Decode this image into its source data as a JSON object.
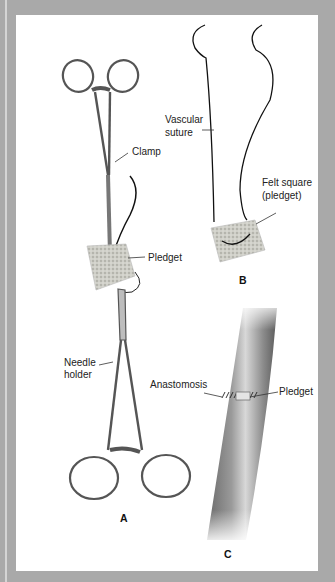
{
  "figure": {
    "panels": [
      {
        "id": "A",
        "label": "A",
        "callouts": [
          "Clamp",
          "Pledget",
          "Needle holder"
        ]
      },
      {
        "id": "B",
        "label": "B",
        "callouts": [
          "Vascular suture",
          "Felt square (pledget)"
        ]
      },
      {
        "id": "C",
        "label": "C",
        "callouts": [
          "Anastomosis",
          "Pledget"
        ]
      }
    ],
    "labels": {
      "clamp": "Clamp",
      "pledget_a": "Pledget",
      "needle_line1": "Needle",
      "needle_line2": "holder",
      "vascular_line1": "Vascular",
      "vascular_line2": "suture",
      "felt_line1": "Felt square",
      "felt_line2": "(pledget)",
      "anastomosis": "Anastomosis",
      "pledget_c": "Pledget",
      "panel_a": "A",
      "panel_b": "B",
      "panel_c": "C"
    },
    "colors": {
      "border": "#a9a9a9",
      "panel": "#ffffff",
      "ink": "#222222",
      "instrument": "#6e6e6e",
      "vessel": "#8a8a8a",
      "felt": "#c8c8c0"
    }
  }
}
